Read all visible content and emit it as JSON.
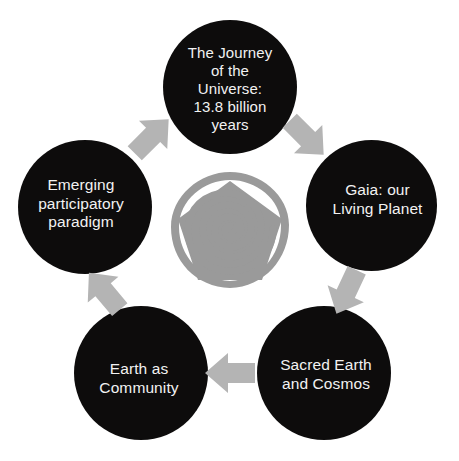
{
  "diagram": {
    "colors": {
      "node_fill": "#0d0c0c",
      "node_text": "#f2f2f2",
      "arrow_fill": "#b4b4b4",
      "emblem_fill": "#9a9a9a",
      "background": "#ffffff"
    },
    "nodes": [
      {
        "id": "journey",
        "label": "The Journey\nof the\nUniverse:\n13.8 billion\nyears",
        "position": "top"
      },
      {
        "id": "gaia",
        "label": "Gaia: our\nLiving Planet",
        "position": "right"
      },
      {
        "id": "sacred",
        "label": "Sacred Earth\nand Cosmos",
        "position": "bottom-right"
      },
      {
        "id": "community",
        "label": "Earth as\nCommunity",
        "position": "bottom-left"
      },
      {
        "id": "emerging",
        "label": "Emerging\nparticipatory\nparadigm",
        "position": "left"
      }
    ],
    "arrows": [
      {
        "id": "journey-to-gaia",
        "from": "journey",
        "to": "gaia",
        "direction": "down-right"
      },
      {
        "id": "gaia-to-sacred",
        "from": "gaia",
        "to": "sacred",
        "direction": "down-left"
      },
      {
        "id": "sacred-to-community",
        "from": "sacred",
        "to": "community",
        "direction": "left"
      },
      {
        "id": "community-to-emerging",
        "from": "community",
        "to": "emerging",
        "direction": "up-left"
      },
      {
        "id": "emerging-to-journey",
        "from": "emerging",
        "to": "journey",
        "direction": "up-right"
      }
    ],
    "center_emblem": {
      "id": "pentagon-spiral-emblem",
      "description": "Pentagon outline enclosing a spiral"
    }
  }
}
